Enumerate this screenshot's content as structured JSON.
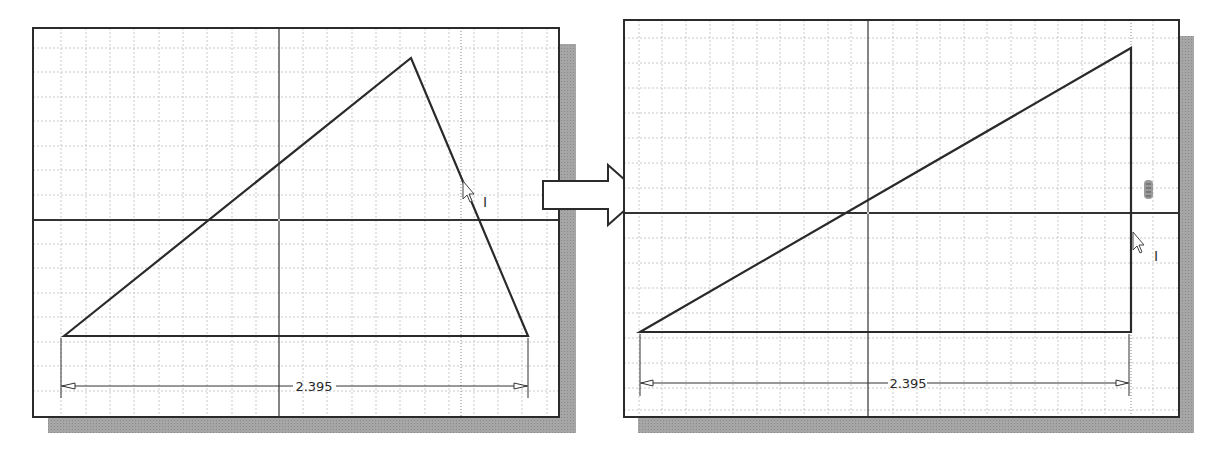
{
  "colors": {
    "background": "#ffffff",
    "frame": "#2b2b2b",
    "shadow": "#9a9a9a",
    "grid": "#c8c8c8",
    "geometry": "#2a2a2a",
    "axis": "#333333"
  },
  "panels": [
    {
      "id": "before",
      "dimension": {
        "value": "2.395"
      },
      "cursor_label": "I",
      "triangle": {
        "points": [
          [
            64,
            336
          ],
          [
            411,
            58
          ],
          [
            528,
            336
          ]
        ]
      }
    },
    {
      "id": "after",
      "dimension": {
        "value": "2.395"
      },
      "cursor_label": "I",
      "constraint_icon": "vertical-constraint-icon",
      "triangle": {
        "points": [
          [
            640,
            332
          ],
          [
            1131,
            48
          ],
          [
            1131,
            332
          ]
        ]
      }
    }
  ],
  "transition_arrow": {
    "direction": "right"
  }
}
